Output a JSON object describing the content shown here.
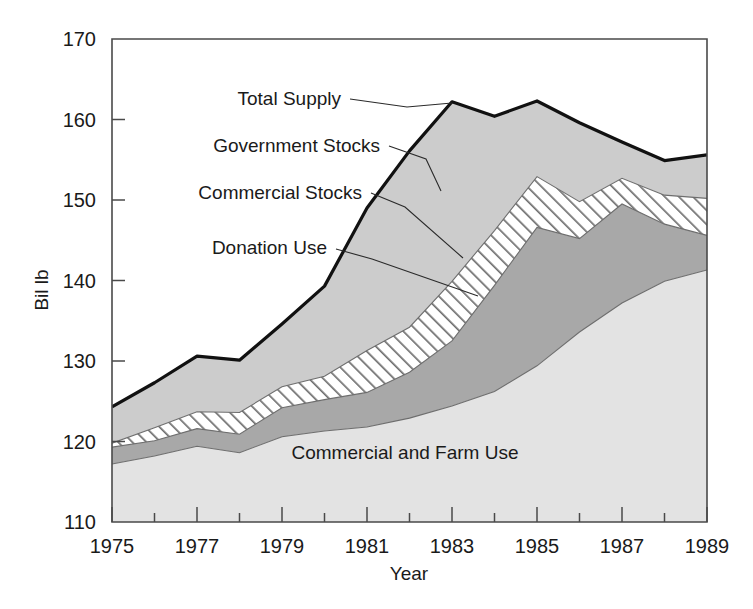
{
  "chart_data": {
    "type": "area",
    "title": "",
    "xlabel": "Year",
    "ylabel": "Bil lb",
    "xlim": [
      1975,
      1989
    ],
    "ylim": [
      110,
      170
    ],
    "x": [
      1975,
      1976,
      1977,
      1978,
      1979,
      1980,
      1981,
      1982,
      1983,
      1984,
      1985,
      1986,
      1987,
      1988,
      1989
    ],
    "x_tick_labels": [
      "1975",
      "1977",
      "1979",
      "1981",
      "1983",
      "1985",
      "1987",
      "1989"
    ],
    "x_tick_values": [
      1975,
      1977,
      1979,
      1981,
      1983,
      1985,
      1987,
      1989
    ],
    "x_minor_tick_values": [
      1976,
      1978,
      1980,
      1982,
      1984,
      1986,
      1988
    ],
    "y_tick_labels": [
      "110",
      "120",
      "130",
      "140",
      "150",
      "160",
      "170"
    ],
    "y_tick_values": [
      110,
      120,
      130,
      140,
      150,
      160,
      170
    ],
    "grid": false,
    "legend": "inline-annotations",
    "stacked": true,
    "baseline": 110,
    "series": [
      {
        "name": "Commercial and Farm Use",
        "fill": "#e3e3e3",
        "pattern": "solid-light",
        "cumulative_top": [
          117.2,
          118.2,
          119.4,
          118.6,
          120.6,
          121.3,
          121.8,
          122.9,
          124.4,
          126.2,
          129.4,
          133.6,
          137.2,
          139.9,
          141.3
        ]
      },
      {
        "name": "Donation Use",
        "fill": "#a8a8a8",
        "pattern": "solid-medium",
        "cumulative_top": [
          119.3,
          120.1,
          121.6,
          120.9,
          124.2,
          125.2,
          126.1,
          128.6,
          132.5,
          139.4,
          146.6,
          145.2,
          149.5,
          147.0,
          145.6
        ]
      },
      {
        "name": "Commercial Stocks",
        "fill": "#ffffff",
        "pattern": "diagonal-hatch",
        "cumulative_top": [
          119.8,
          121.7,
          123.7,
          123.6,
          126.8,
          128.1,
          131.3,
          134.2,
          139.9,
          146.2,
          152.9,
          149.8,
          152.7,
          150.6,
          150.2
        ]
      },
      {
        "name": "Government Stocks",
        "fill": "#cccccc",
        "pattern": "solid-lightgray",
        "cumulative_top": [
          124.3,
          127.3,
          130.6,
          130.1,
          134.6,
          139.3,
          149.0,
          156.1,
          162.2,
          160.4,
          162.3,
          159.6,
          157.2,
          154.9,
          155.6
        ]
      }
    ],
    "total_supply": {
      "name": "Total Supply",
      "values": [
        124.3,
        127.3,
        130.6,
        130.1,
        134.6,
        139.3,
        149.0,
        156.1,
        162.2,
        160.4,
        162.3,
        159.6,
        157.2,
        154.9,
        155.6
      ]
    },
    "annotations": [
      {
        "label": "Total Supply",
        "text_x": 341,
        "text_y": 105,
        "anchor": "end",
        "leader": [
          [
            350,
            99
          ],
          [
            407,
            107
          ],
          [
            452,
            103
          ]
        ]
      },
      {
        "label": "Government Stocks",
        "text_x": 380,
        "text_y": 152,
        "anchor": "end",
        "leader": [
          [
            389,
            146
          ],
          [
            426,
            159
          ],
          [
            441,
            191
          ]
        ]
      },
      {
        "label": "Commercial Stocks",
        "text_x": 362,
        "text_y": 199,
        "anchor": "end",
        "leader": [
          [
            371,
            193
          ],
          [
            405,
            207
          ],
          [
            463,
            258
          ]
        ]
      },
      {
        "label": "Donation Use",
        "text_x": 327,
        "text_y": 254,
        "anchor": "end",
        "leader": [
          [
            336,
            249
          ],
          [
            372,
            259
          ],
          [
            478,
            296
          ]
        ]
      },
      {
        "label": "Commercial and Farm Use",
        "text_x": 405,
        "text_y": 459,
        "anchor": "middle",
        "leader": null
      }
    ]
  }
}
